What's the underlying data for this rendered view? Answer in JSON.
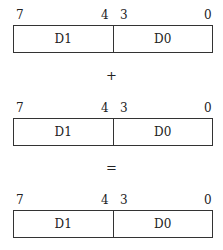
{
  "registers": [
    {
      "bits": {
        "b7": "7",
        "b4": "4",
        "b3": "3",
        "b0": "0"
      },
      "high": "D1",
      "low": "D0"
    },
    {
      "bits": {
        "b7": "7",
        "b4": "4",
        "b3": "3",
        "b0": "0"
      },
      "high": "D1",
      "low": "D0"
    },
    {
      "bits": {
        "b7": "7",
        "b4": "4",
        "b3": "3",
        "b0": "0"
      },
      "high": "D1",
      "low": "D0"
    }
  ],
  "operators": {
    "plus": "+",
    "equals": "="
  }
}
